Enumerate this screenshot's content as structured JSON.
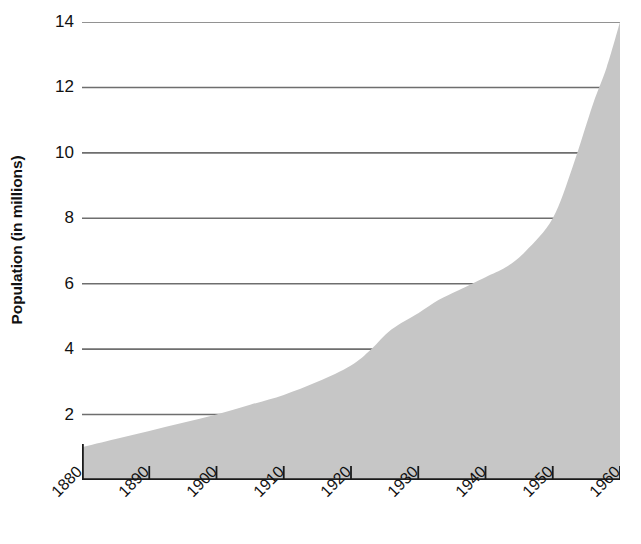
{
  "chart_data": {
    "type": "area",
    "title": "",
    "subtitle": "",
    "xlabel": "",
    "ylabel": "Population (in millions)",
    "x": [
      1880,
      1890,
      1900,
      1910,
      1920,
      1930,
      1940,
      1950,
      1960
    ],
    "values": [
      1.0,
      1.5,
      2.0,
      2.6,
      3.5,
      5.1,
      6.2,
      8.0,
      14.0
    ],
    "series": [
      {
        "name": "Population",
        "values": [
          1.0,
          1.5,
          2.0,
          2.6,
          3.5,
          5.1,
          6.2,
          8.0,
          14.0
        ]
      }
    ],
    "x_tick_labels": [
      "1880",
      "1890",
      "1900",
      "1910",
      "1920",
      "1930",
      "1940",
      "1950",
      "1960"
    ],
    "y_tick_labels": [
      "2",
      "4",
      "6",
      "8",
      "10",
      "12",
      "14"
    ],
    "y_ticks": [
      2,
      4,
      6,
      8,
      10,
      12,
      14
    ],
    "xlim": [
      1880,
      1960
    ],
    "ylim": [
      0,
      14
    ],
    "grid": "horizontal",
    "legend": "none",
    "fill_color": "#c6c6c6",
    "grid_color": "#6e6e6e",
    "axis_color": "#1a1a1a",
    "text_color": "#111111",
    "x_tick_rotation": -45,
    "y_label_rotation": -90,
    "dense_points": {
      "x": [
        1880,
        1885,
        1890,
        1895,
        1900,
        1905,
        1910,
        1915,
        1920,
        1923,
        1926,
        1930,
        1933,
        1936,
        1940,
        1943,
        1946,
        1950,
        1953,
        1956,
        1958,
        1960
      ],
      "y": [
        1.0,
        1.25,
        1.5,
        1.75,
        2.0,
        2.3,
        2.6,
        3.0,
        3.5,
        4.0,
        4.6,
        5.1,
        5.5,
        5.8,
        6.2,
        6.5,
        7.0,
        8.0,
        9.6,
        11.5,
        12.6,
        14.0
      ]
    }
  }
}
